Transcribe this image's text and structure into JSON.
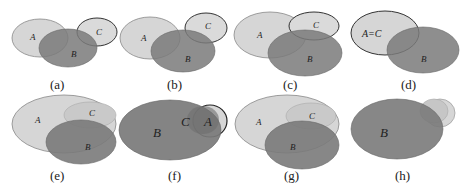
{
  "figure": {
    "panels": [
      {
        "caption": "(a)",
        "labels": {
          "A": "A",
          "B": "B",
          "C": "C"
        }
      },
      {
        "caption": "(b)",
        "labels": {
          "A": "A",
          "B": "B",
          "C": "C"
        }
      },
      {
        "caption": "(c)",
        "labels": {
          "A": "A",
          "B": "B",
          "C": "C"
        }
      },
      {
        "caption": "(d)",
        "labels": {
          "AC": "A=C",
          "B": "B"
        }
      },
      {
        "caption": "(e)",
        "labels": {
          "A": "A",
          "B": "B",
          "C": "C"
        }
      },
      {
        "caption": "(f)",
        "labels": {
          "A": "A",
          "B": "B",
          "C": "C"
        }
      },
      {
        "caption": "(g)",
        "labels": {
          "A": "A",
          "B": "B",
          "C": "C"
        }
      },
      {
        "caption": "(h)",
        "labels": {
          "B": "B"
        }
      }
    ],
    "colors": {
      "light_set": "#d4d4d4",
      "dark_set": "#7a7a7a",
      "outline": "#555555",
      "c_outline": "#333333"
    }
  }
}
